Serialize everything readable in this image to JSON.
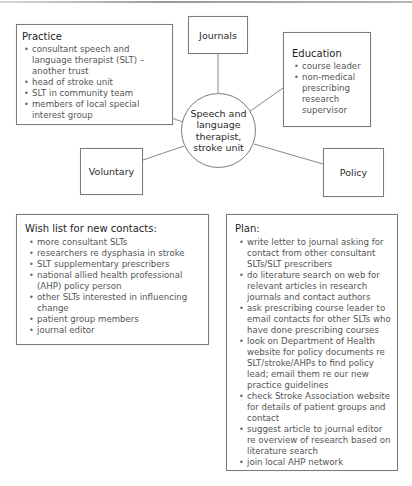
{
  "diagram": {
    "hub": {
      "label": "Speech and language therapist, stroke unit"
    },
    "nodes": {
      "practice": {
        "title": "Practice",
        "items": [
          "consultant speech and language therapist (SLT) – another trust",
          "head of stroke unit",
          "SLT in community team",
          "members of local special interest group"
        ]
      },
      "journals": {
        "label": "Journals"
      },
      "education": {
        "title": "Education",
        "items": [
          "course leader",
          "non-medical prescribing research supervisor"
        ]
      },
      "voluntary": {
        "label": "Voluntary"
      },
      "policy": {
        "label": "Policy"
      }
    },
    "wishlist": {
      "title": "Wish list for new contacts:",
      "items": [
        "more consultant SLTs",
        "researchers re dysphasia in stroke",
        "SLT supplementary prescribers",
        "national allied health professional (AHP) policy person",
        "other SLTs interested in influencing change",
        "patient group members",
        "journal editor"
      ]
    },
    "plan": {
      "title": "Plan:",
      "items": [
        "write letter to journal asking for contact from other consultant SLTs/SLT prescribers",
        "do literature search on web for relevant articles in research journals and contact authors",
        "ask prescribing course leader to email contacts for other SLTs who have done prescribing courses",
        "look on Department of Health website for policy documents re SLT/stroke/AHPs to find policy lead; email them re our new practice guidelines",
        "check Stroke Association website for details of patient groups and contact",
        "suggest article to journal editor re overview of research based on literature search",
        "join local AHP network"
      ]
    },
    "colors": {
      "border": "#7a7a7a",
      "heading_text": "#1e1e1e",
      "body_text": "#555555",
      "connector": "#6a6a6a"
    }
  }
}
